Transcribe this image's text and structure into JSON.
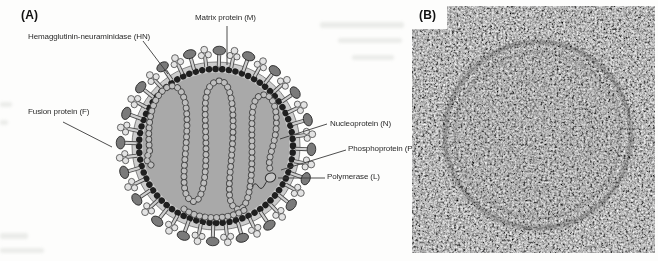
{
  "figure": {
    "panel_a": {
      "label": "(A)",
      "callouts": [
        {
          "id": "hn",
          "text": "Hemagglutinin-neuraminidase (HN)"
        },
        {
          "id": "matrix",
          "text": "Matrix protein (M)"
        },
        {
          "id": "fusion",
          "text": "Fusion protein (F)"
        },
        {
          "id": "nucleoprotein",
          "text": "Nucleoprotein (N)"
        },
        {
          "id": "phosphoprotein",
          "text": "Phosphoprotein (P)"
        },
        {
          "id": "polymerase",
          "text": "Polymerase (L)"
        }
      ]
    },
    "panel_b": {
      "label": "(B)"
    }
  },
  "colors": {
    "background": "#fdfdfc",
    "membrane_beads": "#1f1f1f",
    "envelope_fill": "#cccccc",
    "interior_fill": "#a9a9a9",
    "spike_stem": "#cfcfcf",
    "hn_spike_head": "#7a7a7a",
    "f_spike_head": "#e3e3e3",
    "nucleocapsid_bead_fill": "#bfbfbf",
    "nucleocapsid_bead_outline": "#4a4a4a",
    "polymerase_fill": "#c6c6c6",
    "label_text": "#2b2b2b",
    "leader_line": "#3a3a3a"
  }
}
